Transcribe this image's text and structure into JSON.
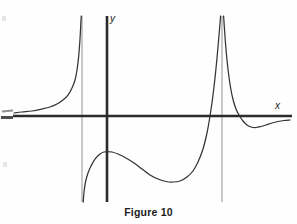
{
  "figure": {
    "caption": "Figure 10",
    "background_color": "#fefefe",
    "ink_color": "#2b2b2b",
    "asymptote_color": "#9a9a9a"
  },
  "axes": {
    "x_axis_label": "x",
    "y_axis_label": "y",
    "origin_px": {
      "x": 107,
      "y": 116
    },
    "x_axis_extent_px": {
      "x1": 13,
      "x2": 292,
      "y": 116
    },
    "y_axis_extent_px": {
      "x": 107,
      "y1": 16,
      "y2": 202
    },
    "axis_line_width_px": 2.6,
    "arrowheads": false,
    "tick_marks": false,
    "gridlines": false
  },
  "chart_data": {
    "type": "line",
    "title": "Figure 10",
    "xlabel": "x",
    "ylabel": "y",
    "grid": false,
    "legend": false,
    "legend_position": "none",
    "xlim_px": [
      13,
      292
    ],
    "ylim_px": [
      16,
      202
    ],
    "horizontal_asymptote": {
      "y_value": 0,
      "y_px": 116
    },
    "vertical_asymptotes": [
      {
        "name": "left-asymptote",
        "x_px": 82,
        "y_top_px": 16,
        "y_bottom_px": 202
      },
      {
        "name": "right-asymptote",
        "x_px": 222,
        "y_top_px": 16,
        "y_bottom_px": 202
      }
    ],
    "branches": [
      {
        "name": "left-branch",
        "note": "Comes in from the far left just above the x-axis (horizontal asymptote y = 0) and rises steeply to +infinity at the left vertical asymptote.",
        "points_px": [
          [
            14,
            113
          ],
          [
            22,
            112
          ],
          [
            32,
            111
          ],
          [
            42,
            109
          ],
          [
            50,
            107
          ],
          [
            57,
            104
          ],
          [
            63,
            100
          ],
          [
            68,
            95
          ],
          [
            72,
            88
          ],
          [
            75,
            80
          ],
          [
            77,
            70
          ],
          [
            78.5,
            58
          ],
          [
            79.6,
            45
          ],
          [
            80.4,
            32
          ],
          [
            81,
            20
          ],
          [
            81.3,
            16
          ]
        ]
      },
      {
        "name": "middle-branch",
        "note": "Comes up from -infinity at the left vertical asymptote, rises to a local maximum near the y-axis, falls to a local minimum, then rises steeply to +infinity at the right vertical asymptote.",
        "points_px": [
          [
            83.2,
            202
          ],
          [
            84,
            192
          ],
          [
            85.5,
            182
          ],
          [
            88,
            173
          ],
          [
            91,
            166
          ],
          [
            95,
            159
          ],
          [
            100,
            154
          ],
          [
            104,
            152
          ],
          [
            107.5,
            151.5
          ],
          [
            112,
            152
          ],
          [
            118,
            154
          ],
          [
            126,
            158
          ],
          [
            134,
            163
          ],
          [
            142,
            169
          ],
          [
            150,
            175
          ],
          [
            158,
            179
          ],
          [
            166,
            181.5
          ],
          [
            173,
            182
          ],
          [
            180,
            181
          ],
          [
            187,
            177
          ],
          [
            193,
            171
          ],
          [
            198,
            162
          ],
          [
            203,
            149
          ],
          [
            207,
            133
          ],
          [
            210,
            116
          ],
          [
            212.5,
            99
          ],
          [
            215,
            78
          ],
          [
            217,
            58
          ],
          [
            218.6,
            40
          ],
          [
            219.8,
            26
          ],
          [
            220.6,
            16
          ]
        ]
      },
      {
        "name": "right-branch",
        "note": "Comes down from +infinity just right of the right vertical asymptote, crosses the x-axis, dips to a local minimum below the axis, then rises back asymptotically toward y = 0.",
        "points_px": [
          [
            223.6,
            16
          ],
          [
            224.4,
            28
          ],
          [
            225.4,
            42
          ],
          [
            226.8,
            58
          ],
          [
            228.6,
            74
          ],
          [
            230.8,
            89
          ],
          [
            233.4,
            101
          ],
          [
            236.4,
            110
          ],
          [
            239.6,
            116
          ],
          [
            243,
            121
          ],
          [
            247,
            125
          ],
          [
            251,
            127
          ],
          [
            256,
            127.5
          ],
          [
            261,
            126.5
          ],
          [
            266,
            125
          ],
          [
            272,
            123
          ],
          [
            278,
            121.5
          ],
          [
            284,
            120.5
          ],
          [
            290,
            120
          ]
        ]
      }
    ],
    "features": {
      "local_maximum_px": [
        107.5,
        151.5
      ],
      "local_minimum_middle_px": [
        173,
        182
      ],
      "local_minimum_right_px": [
        253,
        127.5
      ],
      "x_intercepts_px": [
        [
          210,
          116
        ],
        [
          239.6,
          116
        ]
      ]
    }
  }
}
